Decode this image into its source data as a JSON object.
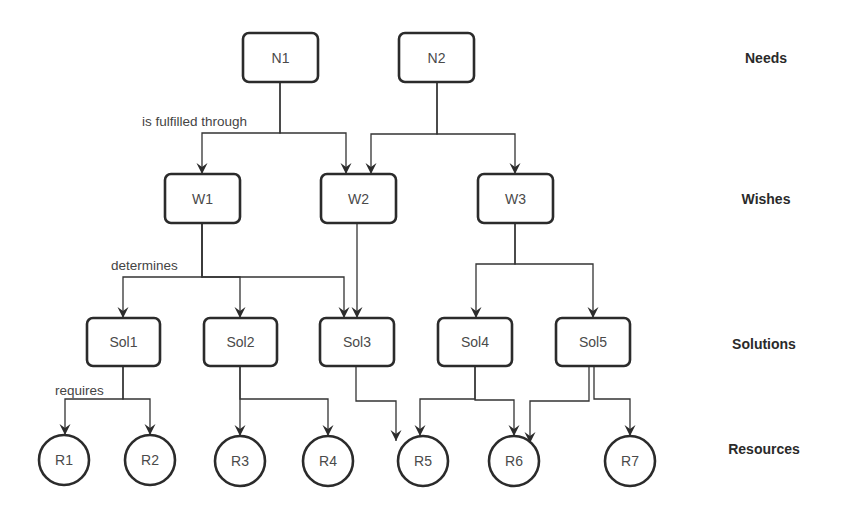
{
  "diagram": {
    "levels": [
      {
        "id": "needs",
        "label": "Needs",
        "x": 766,
        "y": 58
      },
      {
        "id": "wishes",
        "label": "Wishes",
        "x": 766,
        "y": 199
      },
      {
        "id": "solutions",
        "label": "Solutions",
        "x": 764,
        "y": 344
      },
      {
        "id": "resources",
        "label": "Resources",
        "x": 764,
        "y": 449
      }
    ],
    "nodes": [
      {
        "id": "N1",
        "label": "N1",
        "shape": "rect",
        "x": 243,
        "y": 33,
        "w": 75,
        "h": 49
      },
      {
        "id": "N2",
        "label": "N2",
        "shape": "rect",
        "x": 399,
        "y": 33,
        "w": 75,
        "h": 49
      },
      {
        "id": "W1",
        "label": "W1",
        "shape": "rect",
        "x": 165,
        "y": 174,
        "w": 75,
        "h": 49
      },
      {
        "id": "W2",
        "label": "W2",
        "shape": "rect",
        "x": 321,
        "y": 174,
        "w": 75,
        "h": 49
      },
      {
        "id": "W3",
        "label": "W3",
        "shape": "rect",
        "x": 478,
        "y": 174,
        "w": 75,
        "h": 49
      },
      {
        "id": "Sol1",
        "label": "Sol1",
        "shape": "rect",
        "x": 87,
        "y": 318,
        "w": 73,
        "h": 48
      },
      {
        "id": "Sol2",
        "label": "Sol2",
        "shape": "rect",
        "x": 204,
        "y": 318,
        "w": 73,
        "h": 48
      },
      {
        "id": "Sol3",
        "label": "Sol3",
        "shape": "rect",
        "x": 320,
        "y": 318,
        "w": 74,
        "h": 48
      },
      {
        "id": "Sol4",
        "label": "Sol4",
        "shape": "rect",
        "x": 438,
        "y": 318,
        "w": 74,
        "h": 48
      },
      {
        "id": "Sol5",
        "label": "Sol5",
        "shape": "rect",
        "x": 556,
        "y": 318,
        "w": 74,
        "h": 48
      },
      {
        "id": "R1",
        "label": "R1",
        "shape": "circle",
        "cx": 64,
        "cy": 460,
        "r": 25
      },
      {
        "id": "R2",
        "label": "R2",
        "shape": "circle",
        "cx": 150,
        "cy": 460,
        "r": 25
      },
      {
        "id": "R3",
        "label": "R3",
        "shape": "circle",
        "cx": 240,
        "cy": 461,
        "r": 25
      },
      {
        "id": "R4",
        "label": "R4",
        "shape": "circle",
        "cx": 328,
        "cy": 461,
        "r": 25
      },
      {
        "id": "R5",
        "label": "R5",
        "shape": "circle",
        "cx": 423,
        "cy": 461,
        "r": 25
      },
      {
        "id": "R6",
        "label": "R6",
        "shape": "circle",
        "cx": 514,
        "cy": 461,
        "r": 25
      },
      {
        "id": "R7",
        "label": "R7",
        "shape": "circle",
        "cx": 630,
        "cy": 461,
        "r": 25
      }
    ],
    "edges": [
      {
        "from": "N1",
        "to": "W1",
        "points": [
          [
            280,
            82
          ],
          [
            280,
            133
          ],
          [
            202,
            133
          ],
          [
            202,
            174
          ]
        ]
      },
      {
        "from": "N1",
        "to": "W2",
        "points": [
          [
            280,
            82
          ],
          [
            280,
            133
          ],
          [
            346,
            133
          ],
          [
            346,
            174
          ]
        ]
      },
      {
        "from": "N2",
        "to": "W2",
        "points": [
          [
            437,
            82
          ],
          [
            437,
            134
          ],
          [
            371,
            134
          ],
          [
            371,
            174
          ]
        ]
      },
      {
        "from": "N2",
        "to": "W3",
        "points": [
          [
            437,
            82
          ],
          [
            437,
            134
          ],
          [
            515,
            134
          ],
          [
            515,
            174
          ]
        ]
      },
      {
        "from": "W1",
        "to": "Sol1",
        "points": [
          [
            202,
            223
          ],
          [
            202,
            277
          ],
          [
            123,
            277
          ],
          [
            123,
            318
          ]
        ]
      },
      {
        "from": "W1",
        "to": "Sol2",
        "points": [
          [
            202,
            223
          ],
          [
            202,
            277
          ],
          [
            240,
            277
          ],
          [
            240,
            318
          ]
        ]
      },
      {
        "from": "W1",
        "to": "Sol3",
        "points": [
          [
            202,
            223
          ],
          [
            202,
            277
          ],
          [
            344,
            277
          ],
          [
            344,
            318
          ]
        ]
      },
      {
        "from": "W2",
        "to": "Sol3",
        "points": [
          [
            357,
            223
          ],
          [
            357,
            318
          ]
        ]
      },
      {
        "from": "W3",
        "to": "Sol4",
        "points": [
          [
            515,
            223
          ],
          [
            515,
            264
          ],
          [
            476,
            264
          ],
          [
            476,
            318
          ]
        ]
      },
      {
        "from": "W3",
        "to": "Sol5",
        "points": [
          [
            515,
            223
          ],
          [
            515,
            264
          ],
          [
            593,
            264
          ],
          [
            593,
            318
          ]
        ]
      },
      {
        "from": "Sol1",
        "to": "R1",
        "points": [
          [
            123,
            366
          ],
          [
            123,
            399
          ],
          [
            65,
            399
          ],
          [
            65,
            435
          ]
        ]
      },
      {
        "from": "Sol1",
        "to": "R2",
        "points": [
          [
            123,
            366
          ],
          [
            123,
            399
          ],
          [
            150,
            399
          ],
          [
            150,
            435
          ]
        ]
      },
      {
        "from": "Sol2",
        "to": "R3",
        "points": [
          [
            240,
            366
          ],
          [
            240,
            436
          ]
        ]
      },
      {
        "from": "Sol2",
        "to": "R4",
        "points": [
          [
            240,
            366
          ],
          [
            240,
            399
          ],
          [
            328,
            399
          ],
          [
            328,
            436
          ]
        ]
      },
      {
        "from": "Sol3",
        "to": "R5",
        "points": [
          [
            356,
            366
          ],
          [
            356,
            401
          ],
          [
            396,
            401
          ],
          [
            396,
            441
          ]
        ]
      },
      {
        "from": "Sol4",
        "to": "R5",
        "points": [
          [
            475,
            366
          ],
          [
            475,
            399
          ],
          [
            420,
            399
          ],
          [
            420,
            436
          ]
        ]
      },
      {
        "from": "Sol4",
        "to": "R6",
        "points": [
          [
            475,
            366
          ],
          [
            475,
            400
          ],
          [
            514,
            400
          ],
          [
            514,
            436
          ]
        ]
      },
      {
        "from": "Sol5",
        "to": "R6",
        "points": [
          [
            589,
            366
          ],
          [
            589,
            401
          ],
          [
            530,
            401
          ],
          [
            530,
            443
          ]
        ]
      },
      {
        "from": "Sol5",
        "to": "R7",
        "points": [
          [
            594,
            366
          ],
          [
            594,
            399
          ],
          [
            630,
            399
          ],
          [
            630,
            436
          ]
        ]
      }
    ],
    "edge_labels": [
      {
        "text": "is fulfilled through",
        "x": 142,
        "y": 126
      },
      {
        "text": "determines",
        "x": 111,
        "y": 270
      },
      {
        "text": "requires",
        "x": 55,
        "y": 395
      }
    ]
  },
  "colors": {
    "stroke": "#2b2b2b",
    "edge": "#333333",
    "node_text": "#4a4a4a",
    "level_text": "#2a2a2a",
    "background": "#ffffff"
  }
}
